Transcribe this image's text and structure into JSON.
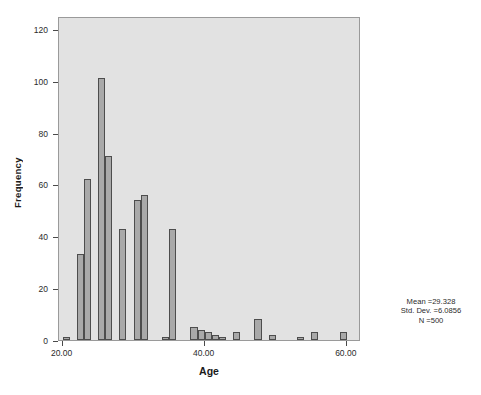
{
  "chart_data": {
    "type": "bar",
    "title": "",
    "subtitle": "",
    "xlabel": "Age",
    "ylabel": "Frequency",
    "xlim": [
      19.5,
      62.0
    ],
    "ylim": [
      0,
      125
    ],
    "grid": false,
    "legend": "none",
    "bin_width": 1,
    "x_ticks": [
      "20.00",
      "40.00",
      "60.00"
    ],
    "x_tick_values": [
      20,
      40,
      60
    ],
    "y_ticks": [
      "0",
      "20",
      "40",
      "60",
      "80",
      "100",
      "120"
    ],
    "y_tick_values": [
      0,
      20,
      40,
      60,
      80,
      100,
      120
    ],
    "categories": [
      20,
      22,
      23,
      25,
      26,
      28,
      30,
      31,
      34,
      35,
      38,
      39,
      40,
      41,
      42,
      44,
      47,
      49,
      53,
      55,
      59
    ],
    "values": [
      1,
      33,
      62,
      101,
      71,
      43,
      54,
      56,
      1,
      43,
      5,
      4,
      3,
      2,
      1,
      3,
      8,
      2,
      1,
      3,
      3
    ],
    "bars": [
      {
        "x": 20,
        "value": 1
      },
      {
        "x": 22,
        "value": 33
      },
      {
        "x": 23,
        "value": 62
      },
      {
        "x": 25,
        "value": 101
      },
      {
        "x": 26,
        "value": 71
      },
      {
        "x": 28,
        "value": 43
      },
      {
        "x": 30,
        "value": 54
      },
      {
        "x": 31,
        "value": 56
      },
      {
        "x": 34,
        "value": 1
      },
      {
        "x": 35,
        "value": 43
      },
      {
        "x": 38,
        "value": 5
      },
      {
        "x": 39,
        "value": 4
      },
      {
        "x": 40,
        "value": 3
      },
      {
        "x": 41,
        "value": 2
      },
      {
        "x": 42,
        "value": 1
      },
      {
        "x": 44,
        "value": 3
      },
      {
        "x": 47,
        "value": 8
      },
      {
        "x": 49,
        "value": 2
      },
      {
        "x": 53,
        "value": 1
      },
      {
        "x": 55,
        "value": 3
      },
      {
        "x": 59,
        "value": 3
      }
    ],
    "annotations": {
      "mean": "Mean =29.328",
      "std_dev": "Std. Dev. =6.0856",
      "n": "N =500"
    },
    "colors": {
      "bar_fill": "#a9a9a9",
      "bar_edge": "#4d4d4d",
      "plot_background": "#e2e2e2",
      "frame": "#9a9a9a",
      "text": "#2b2b2b"
    }
  }
}
